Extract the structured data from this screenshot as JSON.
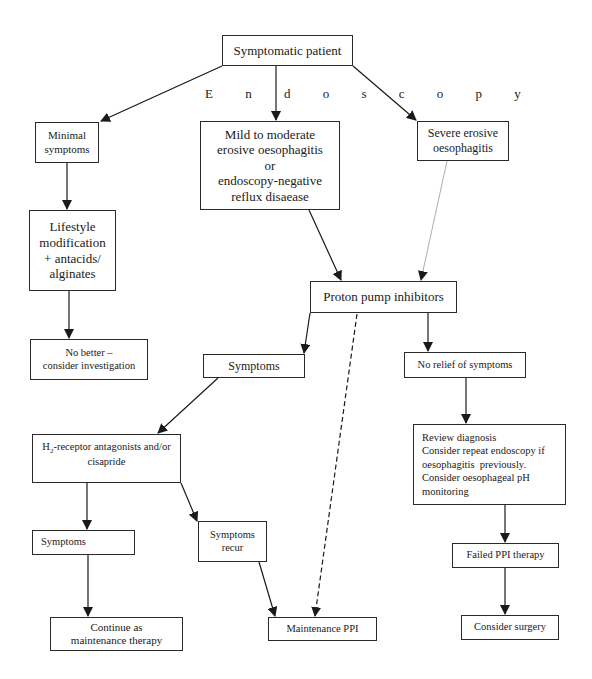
{
  "diagram": {
    "edge_label": "E n d o s c o p y",
    "nodes": {
      "symptomatic_patient": "Symptomatic patient",
      "minimal_symptoms": [
        "Minimal",
        "symptoms"
      ],
      "mild_moderate": [
        "Mild to moderate",
        "erosive oesophagitis",
        "or",
        "endoscopy-negative",
        "reflux disaease"
      ],
      "severe_erosive": [
        "Severe erosive",
        "oesophagitis"
      ],
      "lifestyle": [
        "Lifestyle",
        "modification",
        "+ antacids/",
        "alginates"
      ],
      "no_better": [
        "No better –",
        "consider investigation"
      ],
      "ppi": "Proton pump inhibitors",
      "symptoms_mid": "Symptoms",
      "no_relief": "No relief of symptoms",
      "h2": {
        "prefix": "H",
        "subscript": "2",
        "line1": "-receptor antagonists and/or",
        "line2": "cisapride"
      },
      "review": [
        "Review diagnosis",
        "Consider repeat endoscopy if",
        "oesophagitis  previously.",
        "Consider oesophageal pH",
        "monitoring"
      ],
      "symptoms_left": "Symptoms",
      "symptoms_recur": [
        "Symptoms",
        "recur"
      ],
      "continue_maintenance": [
        "Continue as",
        "maintenance therapy"
      ],
      "maintenance_ppi": "Maintenance PPI",
      "failed_ppi": "Failed PPI therapy",
      "consider_surgery": "Consider surgery"
    },
    "edges": [
      {
        "from": "symptomatic_patient",
        "to": "minimal_symptoms",
        "style": "solid"
      },
      {
        "from": "symptomatic_patient",
        "to": "mild_moderate",
        "style": "solid"
      },
      {
        "from": "symptomatic_patient",
        "to": "severe_erosive",
        "style": "solid"
      },
      {
        "from": "minimal_symptoms",
        "to": "lifestyle",
        "style": "solid"
      },
      {
        "from": "lifestyle",
        "to": "no_better",
        "style": "solid"
      },
      {
        "from": "mild_moderate",
        "to": "ppi",
        "style": "solid"
      },
      {
        "from": "severe_erosive",
        "to": "ppi",
        "style": "thin"
      },
      {
        "from": "ppi",
        "to": "symptoms_mid",
        "style": "solid"
      },
      {
        "from": "ppi",
        "to": "maintenance_ppi",
        "style": "dashed"
      },
      {
        "from": "ppi",
        "to": "no_relief",
        "style": "solid"
      },
      {
        "from": "symptoms_mid",
        "to": "h2",
        "style": "solid"
      },
      {
        "from": "no_relief",
        "to": "review",
        "style": "solid"
      },
      {
        "from": "h2",
        "to": "symptoms_left",
        "style": "solid"
      },
      {
        "from": "h2",
        "to": "symptoms_recur",
        "style": "solid"
      },
      {
        "from": "symptoms_left",
        "to": "continue_maintenance",
        "style": "solid"
      },
      {
        "from": "symptoms_recur",
        "to": "maintenance_ppi",
        "style": "solid"
      },
      {
        "from": "review",
        "to": "failed_ppi",
        "style": "solid"
      },
      {
        "from": "failed_ppi",
        "to": "consider_surgery",
        "style": "solid"
      }
    ]
  }
}
